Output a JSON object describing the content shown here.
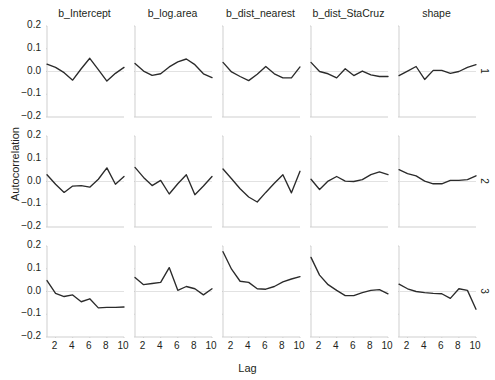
{
  "figure": {
    "width": 495,
    "height": 380,
    "ylabel": "Autocorrelation",
    "xlabel": "Lag",
    "line_color": "#2b2b2b",
    "zero_line_color": "#e2e2e2",
    "axis_color": "#cfcfcf",
    "background": "#ffffff"
  },
  "chart_data": {
    "type": "line",
    "title": "",
    "xlabel": "Lag",
    "ylabel": "Autocorrelation",
    "xlim": [
      1,
      10
    ],
    "ylim": [
      -0.2,
      0.2
    ],
    "xticks": [
      2,
      4,
      6,
      8,
      10
    ],
    "yticks": [
      -0.2,
      -0.1,
      0.0,
      0.1,
      0.2
    ],
    "ytick_labels": [
      "-0.2",
      "-0.1",
      "0.0",
      "0.1",
      "0.2"
    ],
    "grid": false,
    "zero_reference_line": 0.0,
    "legend": "none",
    "facet_columns": [
      "b_Intercept",
      "b_log.area",
      "b_dist_nearest",
      "b_dist_StaCruz",
      "shape"
    ],
    "facet_rows": [
      "1",
      "2",
      "3"
    ],
    "x": [
      1,
      2,
      3,
      4,
      5,
      6,
      7,
      8,
      9,
      10
    ],
    "panels": [
      {
        "column": "b_Intercept",
        "row": "1",
        "values": [
          0.032,
          0.018,
          -0.005,
          -0.038,
          0.012,
          0.058,
          0.008,
          -0.042,
          -0.008,
          0.018
        ]
      },
      {
        "column": "b_log.area",
        "row": "1",
        "values": [
          0.035,
          0.002,
          -0.017,
          -0.01,
          0.02,
          0.042,
          0.055,
          0.03,
          -0.01,
          -0.027
        ]
      },
      {
        "column": "b_dist_nearest",
        "row": "1",
        "values": [
          0.04,
          -0.002,
          -0.022,
          -0.04,
          -0.012,
          0.022,
          -0.01,
          -0.028,
          -0.028,
          0.02
        ]
      },
      {
        "column": "b_dist_StaCruz",
        "row": "1",
        "values": [
          0.04,
          0.0,
          -0.01,
          -0.028,
          0.012,
          -0.018,
          0.002,
          -0.015,
          -0.022,
          -0.022
        ]
      },
      {
        "column": "shape",
        "row": "1",
        "values": [
          -0.018,
          0.002,
          0.022,
          -0.035,
          0.005,
          0.005,
          -0.008,
          0.0,
          0.018,
          0.03
        ]
      },
      {
        "column": "b_Intercept",
        "row": "2",
        "values": [
          0.03,
          -0.012,
          -0.048,
          -0.02,
          -0.018,
          -0.025,
          0.01,
          0.06,
          -0.012,
          0.022
        ]
      },
      {
        "column": "b_log.area",
        "row": "2",
        "values": [
          0.062,
          0.018,
          -0.018,
          0.005,
          -0.055,
          -0.01,
          0.03,
          -0.058,
          -0.02,
          0.022
        ]
      },
      {
        "column": "b_dist_nearest",
        "row": "2",
        "values": [
          0.055,
          0.012,
          -0.032,
          -0.068,
          -0.09,
          -0.048,
          -0.008,
          0.03,
          -0.05,
          0.045
        ]
      },
      {
        "column": "b_dist_StaCruz",
        "row": "2",
        "values": [
          0.01,
          -0.035,
          0.002,
          0.022,
          0.002,
          0.0,
          0.008,
          0.03,
          0.042,
          0.03
        ]
      },
      {
        "column": "shape",
        "row": "2",
        "values": [
          0.052,
          0.035,
          0.025,
          0.002,
          -0.01,
          -0.01,
          0.005,
          0.005,
          0.008,
          0.025
        ]
      },
      {
        "column": "b_Intercept",
        "row": "3",
        "values": [
          0.048,
          -0.008,
          -0.022,
          -0.015,
          -0.045,
          -0.032,
          -0.072,
          -0.07,
          -0.07,
          -0.068
        ]
      },
      {
        "column": "b_log.area",
        "row": "3",
        "values": [
          0.062,
          0.03,
          0.035,
          0.04,
          0.105,
          0.005,
          0.022,
          0.012,
          -0.015,
          0.012
        ]
      },
      {
        "column": "b_dist_nearest",
        "row": "3",
        "values": [
          0.175,
          0.098,
          0.045,
          0.04,
          0.012,
          0.01,
          0.022,
          0.042,
          0.055,
          0.065
        ]
      },
      {
        "column": "b_dist_StaCruz",
        "row": "3",
        "values": [
          0.15,
          0.072,
          0.03,
          0.005,
          -0.018,
          -0.018,
          -0.005,
          0.005,
          0.008,
          -0.01
        ]
      },
      {
        "column": "shape",
        "row": "3",
        "values": [
          0.032,
          0.012,
          0.0,
          -0.005,
          -0.008,
          -0.01,
          -0.03,
          0.012,
          0.005,
          -0.078
        ]
      }
    ]
  },
  "axes": {
    "xtick_labels": [
      "2",
      "4",
      "6",
      "8",
      "10"
    ],
    "ytick_labels": [
      "0.2",
      "0.1",
      "0.0",
      "-0.1",
      "-0.2"
    ]
  }
}
